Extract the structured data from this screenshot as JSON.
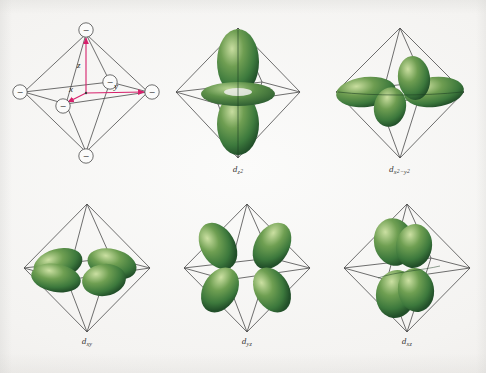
{
  "figure": {
    "background_color": "#f3f2f0",
    "orbital_color": "#3f7a3f",
    "orbital_highlight": "#cfe0a8",
    "orbital_shadow": "#24502a",
    "octahedron_line_color": "#4a4a4a",
    "axis_color": "#d6206b",
    "ligand_label": "−"
  },
  "panels": [
    {
      "id": "axes-diagram",
      "kind": "octahedron-axes",
      "caption": null,
      "axes": [
        {
          "name": "z",
          "label": "z",
          "direction": "up"
        },
        {
          "name": "y",
          "label": "y",
          "direction": "right"
        },
        {
          "name": "x",
          "label": "x",
          "direction": "lower-left"
        }
      ],
      "ligand_count": 6,
      "ligand_charge": "−"
    },
    {
      "id": "dz2",
      "kind": "orbital",
      "caption": {
        "base": "d",
        "sub": "z",
        "sub_sup": "2"
      },
      "caption_text": "dz2"
    },
    {
      "id": "dx2-y2",
      "kind": "orbital",
      "caption": {
        "base": "d",
        "sub": "x",
        "sub_sup": "2",
        "sub2": "−y",
        "sub2_sup": "2"
      },
      "caption_text": "dx2-y2"
    },
    {
      "id": "dxy",
      "kind": "orbital",
      "caption": {
        "base": "d",
        "sub": "xy"
      },
      "caption_text": "dxy"
    },
    {
      "id": "dyz",
      "kind": "orbital",
      "caption": {
        "base": "d",
        "sub": "yz"
      },
      "caption_text": "dyz"
    },
    {
      "id": "dxz",
      "kind": "orbital",
      "caption": {
        "base": "d",
        "sub": "xz"
      },
      "caption_text": "dxz"
    }
  ]
}
